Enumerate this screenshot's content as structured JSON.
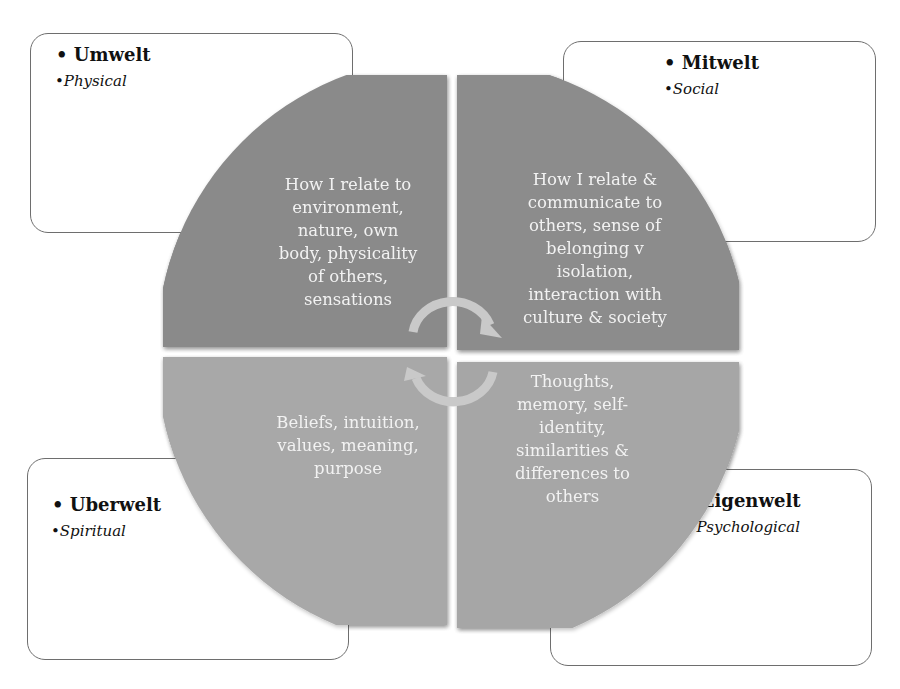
{
  "diagram": {
    "type": "four-worlds-quadrant",
    "boxes": {
      "umwelt": {
        "title": "• Umwelt",
        "subtitle": "•Physical"
      },
      "mitwelt": {
        "title": "• Mitwelt",
        "subtitle": "•Social"
      },
      "uberwelt": {
        "title": "• Uberwelt",
        "subtitle": "•Spiritual"
      },
      "eigenwelt": {
        "title": "• Eigenwelt",
        "subtitle": "• Psychological"
      }
    },
    "quadrants": {
      "top_left": {
        "lines": [
          "How I relate to",
          "environment,",
          "nature, own",
          "body, physicality",
          "of others,",
          "sensations"
        ]
      },
      "top_right": {
        "lines": [
          "How I relate &",
          "communicate to",
          "others, sense of",
          "belonging v",
          "isolation,",
          "interaction with",
          "culture & society"
        ]
      },
      "bottom_left": {
        "lines": [
          "Beliefs, intuition,",
          "values, meaning,",
          "purpose"
        ]
      },
      "bottom_right": {
        "lines": [
          "Thoughts,",
          "memory, self-",
          "identity,",
          "similarities &",
          "differences to",
          "others"
        ]
      }
    },
    "colors": {
      "top_quadrants": "#8a8a8a",
      "bottom_quadrants": "#a8a8a8",
      "arrows": "#c9c9c9",
      "quadrant_text": "#f2f2f2",
      "box_border": "#6e6e6e"
    },
    "center_icon": "cycle-arrows-icon"
  }
}
